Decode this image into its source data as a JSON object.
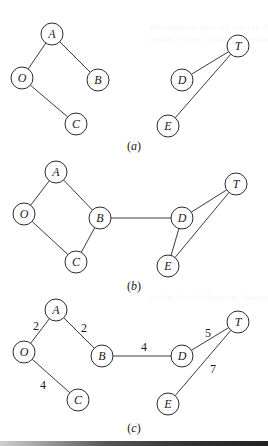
{
  "figure": {
    "panels": [
      {
        "id": "a",
        "caption": "a",
        "caption_pos": [
          134,
          150
        ],
        "nodes": [
          {
            "id": "A",
            "x": 52,
            "y": 34
          },
          {
            "id": "O",
            "x": 22,
            "y": 78
          },
          {
            "id": "B",
            "x": 98,
            "y": 80
          },
          {
            "id": "C",
            "x": 76,
            "y": 124
          },
          {
            "id": "T",
            "x": 238,
            "y": 46
          },
          {
            "id": "D",
            "x": 182,
            "y": 80
          },
          {
            "id": "E",
            "x": 168,
            "y": 126
          }
        ],
        "edges": [
          {
            "from": "A",
            "to": "O"
          },
          {
            "from": "A",
            "to": "B"
          },
          {
            "from": "O",
            "to": "C"
          },
          {
            "from": "T",
            "to": "D"
          },
          {
            "from": "T",
            "to": "E"
          }
        ]
      },
      {
        "id": "b",
        "caption": "b",
        "caption_pos": [
          134,
          290
        ],
        "nodes": [
          {
            "id": "A",
            "x": 56,
            "y": 172
          },
          {
            "id": "O",
            "x": 24,
            "y": 214
          },
          {
            "id": "B",
            "x": 100,
            "y": 218
          },
          {
            "id": "C",
            "x": 76,
            "y": 262
          },
          {
            "id": "T",
            "x": 236,
            "y": 184
          },
          {
            "id": "D",
            "x": 182,
            "y": 218
          },
          {
            "id": "E",
            "x": 168,
            "y": 266
          }
        ],
        "edges": [
          {
            "from": "A",
            "to": "O"
          },
          {
            "from": "A",
            "to": "B"
          },
          {
            "from": "O",
            "to": "C"
          },
          {
            "from": "B",
            "to": "C"
          },
          {
            "from": "B",
            "to": "D"
          },
          {
            "from": "D",
            "to": "T"
          },
          {
            "from": "D",
            "to": "E"
          },
          {
            "from": "T",
            "to": "E"
          }
        ]
      },
      {
        "id": "c",
        "caption": "c",
        "caption_pos": [
          134,
          432
        ],
        "nodes": [
          {
            "id": "A",
            "x": 56,
            "y": 310
          },
          {
            "id": "O",
            "x": 24,
            "y": 352
          },
          {
            "id": "B",
            "x": 102,
            "y": 356
          },
          {
            "id": "C",
            "x": 78,
            "y": 400
          },
          {
            "id": "T",
            "x": 238,
            "y": 322
          },
          {
            "id": "D",
            "x": 182,
            "y": 356
          },
          {
            "id": "E",
            "x": 168,
            "y": 404
          }
        ],
        "edges": [
          {
            "from": "A",
            "to": "O",
            "weight": "2",
            "label_pos": [
              36,
              330
            ]
          },
          {
            "from": "A",
            "to": "B",
            "weight": "2",
            "label_pos": [
              84,
              332
            ]
          },
          {
            "from": "O",
            "to": "C",
            "weight": "4",
            "label_pos": [
              43,
              389
            ]
          },
          {
            "from": "B",
            "to": "D",
            "weight": "4",
            "label_pos": [
              144,
              351
            ]
          },
          {
            "from": "D",
            "to": "T",
            "weight": "5",
            "label_pos": [
              208,
              337
            ]
          },
          {
            "from": "T",
            "to": "E",
            "weight": "7",
            "label_pos": [
              213,
              373
            ]
          }
        ]
      }
    ],
    "node_radius": 11
  }
}
